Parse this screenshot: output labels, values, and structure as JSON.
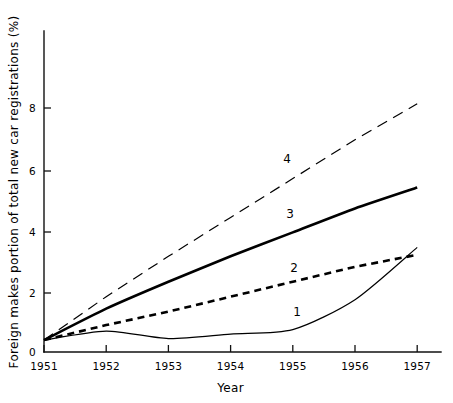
{
  "figure": {
    "background_color": "#ffffff",
    "line_color": "#000000"
  },
  "axes": {
    "y_title": "Foreign makes portion of total new car registrations (%)",
    "x_title": "Year",
    "y_ticks": [
      "0",
      "2",
      "4",
      "6",
      "8"
    ],
    "x_ticks": [
      "1951",
      "1952",
      "1953",
      "1954",
      "1955",
      "1956",
      "1957"
    ]
  },
  "series_labels": {
    "one": "1",
    "two": "2",
    "three": "3",
    "four": "4"
  },
  "chart_data": {
    "type": "line",
    "title": "",
    "subtitle": "",
    "xlabel": "Year",
    "ylabel": "Foreign makes portion of total new car registrations (%)",
    "x": [
      1951,
      1952,
      1953,
      1954,
      1955,
      1956,
      1957
    ],
    "xlim": [
      1951,
      1957
    ],
    "ylim": [
      0,
      9
    ],
    "yticks": [
      0,
      2,
      4,
      6,
      8
    ],
    "xticks": [
      1951,
      1952,
      1953,
      1954,
      1955,
      1956,
      1957
    ],
    "grid": false,
    "legend_position": "inline-curve-labels",
    "series": [
      {
        "name": "1",
        "label": "1",
        "style": "solid-thin",
        "color": "#000000",
        "values": [
          0.4,
          0.7,
          0.45,
          0.6,
          0.75,
          1.75,
          3.5
        ]
      },
      {
        "name": "2",
        "label": "2",
        "style": "dashed-thick",
        "color": "#000000",
        "values": [
          0.4,
          0.9,
          1.35,
          1.85,
          2.35,
          2.85,
          3.25
        ]
      },
      {
        "name": "3",
        "label": "3",
        "style": "solid-thick",
        "color": "#000000",
        "values": [
          0.4,
          1.45,
          2.35,
          3.2,
          4.0,
          4.8,
          5.5
        ]
      },
      {
        "name": "4",
        "label": "4",
        "style": "long-dashed-thin",
        "color": "#000000",
        "values": [
          0.4,
          1.85,
          3.2,
          4.5,
          5.8,
          7.1,
          8.3
        ]
      }
    ],
    "annotations": [
      {
        "text": "4",
        "x": 1955.0,
        "y": 6.4
      },
      {
        "text": "3",
        "x": 1955.0,
        "y": 4.6
      },
      {
        "text": "2",
        "x": 1955.1,
        "y": 2.8
      },
      {
        "text": "1",
        "x": 1955.2,
        "y": 1.4
      }
    ]
  }
}
